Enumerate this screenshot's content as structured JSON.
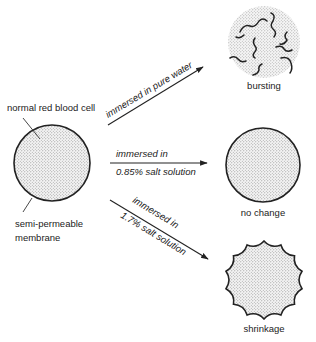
{
  "diagram": {
    "type": "osmosis-red-blood-cell",
    "source_cell": {
      "label": "normal red blood cell",
      "membrane_label_line1": "semi-permeable",
      "membrane_label_line2": "membrane"
    },
    "conditions": [
      {
        "id": "pure-water",
        "arrow_label_line1": "immersed in pure water",
        "arrow_label_line2": "",
        "result": "bursting",
        "shape": "burst-cell"
      },
      {
        "id": "isotonic",
        "arrow_label_line1": "immersed in",
        "arrow_label_line2": "0.85% salt solution",
        "result": "no change",
        "shape": "round-cell"
      },
      {
        "id": "hypertonic",
        "arrow_label_line1": "immersed in",
        "arrow_label_line2": "1.7% salt solution",
        "result": "shrinkage",
        "shape": "crenated-cell"
      }
    ],
    "colors": {
      "outline": "#222222",
      "stipple": "#9a9a9a",
      "background": "#ffffff"
    }
  }
}
